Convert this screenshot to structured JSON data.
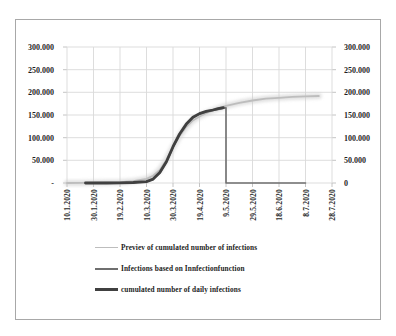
{
  "figure": {
    "background": "#ffffff",
    "border_color": "#a8a8a8"
  },
  "chart_data": {
    "type": "line",
    "title": "",
    "xlabel": "",
    "ylabel": "",
    "ylim": [
      0,
      300000
    ],
    "grid": true,
    "style": {
      "grid_color": "#d9d9d9",
      "tick_color": "#bdbdbd",
      "text_color": "#1f1f1f"
    },
    "x_axis": {
      "tick_labels": [
        "10.1.2020",
        "30.1.2020",
        "19.2.2020",
        "10.3.2020",
        "30.3.2020",
        "19.4.2020",
        "9.5.2020",
        "29.5.2020",
        "18.6.2020",
        "8.7.2020",
        "28.7.2020"
      ],
      "tick_days": [
        0,
        20,
        40,
        60,
        80,
        100,
        120,
        140,
        160,
        180,
        200
      ],
      "label_rotation_deg": -90
    },
    "y_axis_left": {
      "tick_labels": [
        "300.000",
        "250.000",
        "200.000",
        "150.000",
        "100.000",
        "50.000",
        "-"
      ],
      "values": [
        300000,
        250000,
        200000,
        150000,
        100000,
        50000,
        0
      ]
    },
    "y_axis_right": {
      "tick_labels": [
        "300.000",
        "250.000",
        "200.000",
        "150.000",
        "100.000",
        "50.000",
        "0"
      ],
      "values": [
        300000,
        250000,
        200000,
        150000,
        100000,
        50000,
        0
      ]
    },
    "legend": {
      "position": "bottom-left"
    },
    "series": [
      {
        "name": "Previev of cumulated number of infections",
        "color": "#bdbdbd",
        "glow": true,
        "glow_color": "#c9c9c9",
        "stroke_width": 1.8,
        "legend_sample_px": 1,
        "points": [
          [
            0,
            0
          ],
          [
            10,
            300
          ],
          [
            20,
            600
          ],
          [
            30,
            1000
          ],
          [
            40,
            1800
          ],
          [
            50,
            4000
          ],
          [
            60,
            9000
          ],
          [
            65,
            16000
          ],
          [
            70,
            29000
          ],
          [
            75,
            51000
          ],
          [
            80,
            79000
          ],
          [
            85,
            104000
          ],
          [
            90,
            124000
          ],
          [
            95,
            138000
          ],
          [
            100,
            147000
          ],
          [
            105,
            154000
          ],
          [
            110,
            160000
          ],
          [
            115,
            165000
          ],
          [
            120,
            170000
          ],
          [
            130,
            177000
          ],
          [
            140,
            182000
          ],
          [
            150,
            186000
          ],
          [
            160,
            188000
          ],
          [
            170,
            190000
          ],
          [
            180,
            191000
          ],
          [
            190,
            192000
          ]
        ]
      },
      {
        "name": "Infections based on Innfectionfunction",
        "color": "#6f6f6f",
        "glow": false,
        "stroke_width": 1.6,
        "legend_sample_px": 2,
        "points": [
          [
            14,
            0
          ],
          [
            30,
            0
          ],
          [
            40,
            300
          ],
          [
            50,
            1000
          ],
          [
            60,
            3000
          ],
          [
            65,
            8000
          ],
          [
            70,
            22000
          ],
          [
            75,
            46000
          ],
          [
            80,
            78000
          ],
          [
            85,
            107000
          ],
          [
            90,
            129000
          ],
          [
            95,
            144000
          ],
          [
            100,
            152000
          ],
          [
            105,
            157000
          ],
          [
            110,
            160000
          ],
          [
            115,
            163000
          ],
          [
            120,
            166000
          ],
          [
            120,
            0
          ],
          [
            180,
            0
          ]
        ]
      },
      {
        "name": "cumulated number of daily infections",
        "color": "#404040",
        "glow": false,
        "stroke_width": 2.8,
        "legend_sample_px": 3,
        "points": [
          [
            14,
            0
          ],
          [
            30,
            0
          ],
          [
            40,
            300
          ],
          [
            50,
            1000
          ],
          [
            60,
            3000
          ],
          [
            65,
            8500
          ],
          [
            70,
            23000
          ],
          [
            75,
            47000
          ],
          [
            80,
            80000
          ],
          [
            85,
            108000
          ],
          [
            90,
            130000
          ],
          [
            95,
            145000
          ],
          [
            100,
            153000
          ],
          [
            105,
            158000
          ],
          [
            110,
            161000
          ],
          [
            114,
            164000
          ],
          [
            118,
            166000
          ]
        ]
      }
    ]
  }
}
